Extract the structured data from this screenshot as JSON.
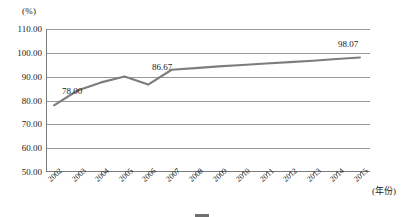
{
  "chart_data": {
    "type": "line",
    "title": "",
    "xlabel": "(年份)",
    "ylabel": "(%)",
    "ylim": [
      50.0,
      110.0
    ],
    "ytick_step": 10.0,
    "yticks": [
      "110.00",
      "100.00",
      "90.00",
      "80.00",
      "70.00",
      "60.00",
      "50.00"
    ],
    "ytick_values": [
      110.0,
      100.0,
      90.0,
      80.0,
      70.0,
      60.0,
      50.0
    ],
    "categories": [
      "2002",
      "2003",
      "2004",
      "2005",
      "2006",
      "2007",
      "2008",
      "2009",
      "2010",
      "2011",
      "2012",
      "2013",
      "2014",
      "2015"
    ],
    "x": [
      2002,
      2003,
      2004,
      2005,
      2006,
      2007,
      2008,
      2009,
      2010,
      2011,
      2012,
      2013,
      2014,
      2015
    ],
    "series": [
      {
        "name": "series-1",
        "color": "#7d7d7d",
        "values": [
          78.0,
          84.2,
          87.6,
          90.1,
          86.67,
          92.9,
          93.6,
          94.3,
          94.9,
          95.5,
          96.1,
          96.7,
          97.4,
          98.07
        ]
      }
    ],
    "data_labels": [
      {
        "category": "2002",
        "value": 78.0,
        "text": "78.00"
      },
      {
        "category": "2006",
        "value": 86.67,
        "text": "86.67"
      },
      {
        "category": "2015",
        "value": 98.07,
        "text": "98.07"
      }
    ],
    "grid": "horizontal",
    "legend_position": "bottom",
    "legend": [
      "series-1"
    ]
  },
  "axis": {
    "unit_label": "(%)",
    "x_title": "(年份)"
  },
  "caption": {
    "text": ""
  }
}
